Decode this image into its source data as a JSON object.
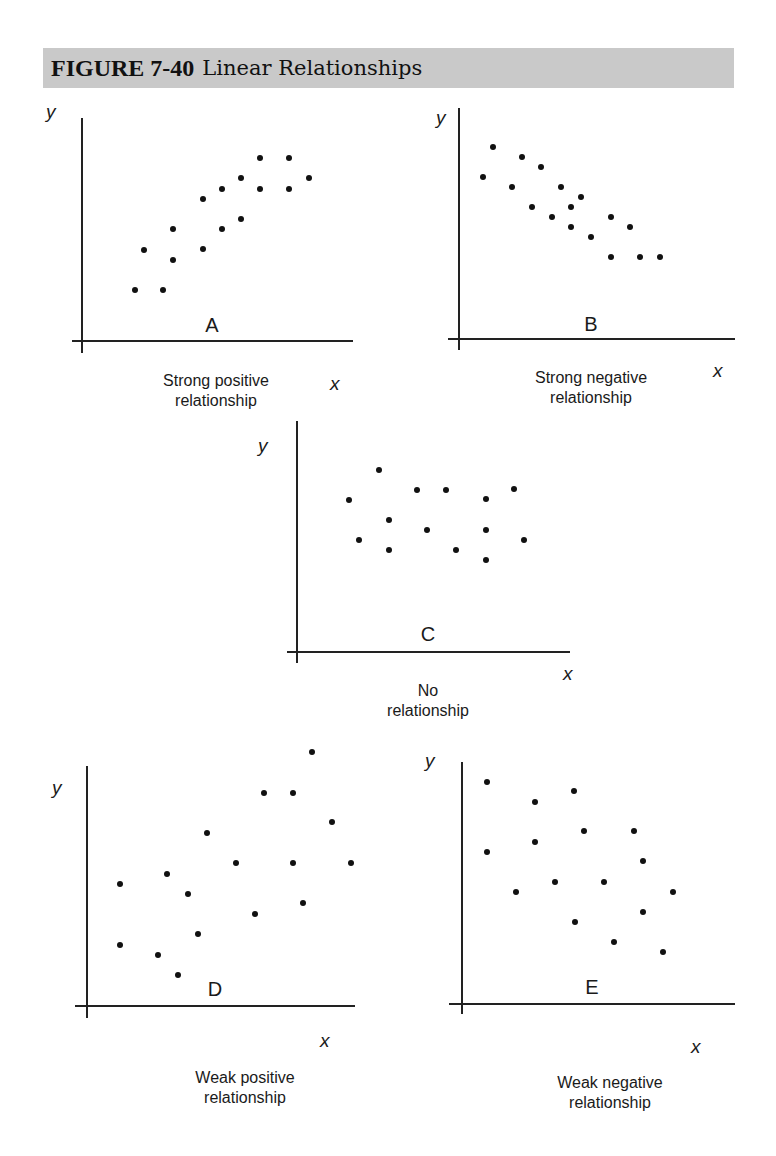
{
  "header": {
    "figure_number": "FIGURE 7-40",
    "title": "Linear Relationships"
  },
  "colors": {
    "header_bg": "#c9c9c9",
    "ink": "#111111"
  },
  "chart_data": [
    {
      "type": "scatter",
      "panel": "A",
      "title": "Strong positive relationship",
      "caption_lines": [
        "Strong positive",
        "relationship"
      ],
      "xlabel": "x",
      "ylabel": "y",
      "grid": false,
      "axes_px": {
        "origin": [
          82,
          341
        ],
        "y_top": 118,
        "y_bottom": 353,
        "x_left": 72,
        "x_right": 353
      },
      "label_px": {
        "y": [
          46,
          118
        ],
        "x": [
          330,
          390
        ],
        "letter": [
          212,
          332
        ],
        "caption": [
          216,
          386
        ]
      },
      "points_px": [
        [
          135,
          290
        ],
        [
          163,
          290
        ],
        [
          144,
          250
        ],
        [
          173,
          229
        ],
        [
          173,
          260
        ],
        [
          203,
          199
        ],
        [
          203,
          249
        ],
        [
          222,
          189
        ],
        [
          222,
          229
        ],
        [
          241,
          178
        ],
        [
          241,
          219
        ],
        [
          260,
          158
        ],
        [
          260,
          189
        ],
        [
          289,
          158
        ],
        [
          289,
          189
        ],
        [
          309,
          178
        ]
      ],
      "points": [
        [
          1.9,
          1.8
        ],
        [
          2.9,
          1.8
        ],
        [
          2.2,
          3.3
        ],
        [
          3.3,
          4.1
        ],
        [
          3.3,
          2.9
        ],
        [
          4.4,
          5.2
        ],
        [
          4.4,
          3.4
        ],
        [
          5.1,
          5.6
        ],
        [
          5.1,
          4.1
        ],
        [
          5.8,
          6.0
        ],
        [
          5.8,
          4.5
        ],
        [
          6.5,
          6.8
        ],
        [
          6.5,
          5.6
        ],
        [
          7.5,
          6.8
        ],
        [
          7.5,
          5.6
        ],
        [
          8.3,
          6.0
        ]
      ]
    },
    {
      "type": "scatter",
      "panel": "B",
      "title": "Strong negative relationship",
      "caption_lines": [
        "Strong negative",
        "relationship"
      ],
      "xlabel": "x",
      "ylabel": "y",
      "grid": false,
      "axes_px": {
        "origin": [
          459,
          339
        ],
        "y_top": 108,
        "y_bottom": 350,
        "x_left": 448,
        "x_right": 735
      },
      "label_px": {
        "y": [
          436,
          124
        ],
        "x": [
          713,
          377
        ],
        "letter": [
          591,
          331
        ],
        "caption": [
          591,
          383
        ]
      },
      "points_px": [
        [
          483,
          177
        ],
        [
          493,
          147
        ],
        [
          512,
          187
        ],
        [
          522,
          157
        ],
        [
          532,
          207
        ],
        [
          541,
          167
        ],
        [
          552,
          217
        ],
        [
          561,
          187
        ],
        [
          571,
          207
        ],
        [
          571,
          227
        ],
        [
          581,
          197
        ],
        [
          591,
          237
        ],
        [
          611,
          217
        ],
        [
          611,
          257
        ],
        [
          630,
          227
        ],
        [
          640,
          257
        ],
        [
          660,
          257
        ]
      ],
      "points": [
        [
          0.9,
          6.1
        ],
        [
          1.3,
          7.2
        ],
        [
          2.0,
          5.7
        ],
        [
          2.4,
          6.8
        ],
        [
          2.8,
          5.0
        ],
        [
          3.1,
          6.4
        ],
        [
          3.5,
          4.6
        ],
        [
          3.8,
          5.7
        ],
        [
          4.2,
          5.0
        ],
        [
          4.2,
          4.2
        ],
        [
          4.6,
          5.3
        ],
        [
          4.9,
          3.9
        ],
        [
          5.6,
          4.6
        ],
        [
          5.6,
          3.1
        ],
        [
          6.4,
          4.2
        ],
        [
          6.7,
          3.1
        ],
        [
          7.5,
          3.1
        ]
      ]
    },
    {
      "type": "scatter",
      "panel": "C",
      "title": "No relationship",
      "caption_lines": [
        "No",
        "relationship"
      ],
      "xlabel": "x",
      "ylabel": "y",
      "grid": false,
      "axes_px": {
        "origin": [
          297,
          652
        ],
        "y_top": 421,
        "y_bottom": 663,
        "x_left": 287,
        "x_right": 570
      },
      "label_px": {
        "y": [
          258,
          452
        ],
        "x": [
          563,
          680
        ],
        "letter": [
          428,
          641
        ],
        "caption": [
          428,
          696
        ]
      },
      "points_px": [
        [
          349,
          500
        ],
        [
          359,
          540
        ],
        [
          379,
          470
        ],
        [
          389,
          520
        ],
        [
          389,
          550
        ],
        [
          417,
          490
        ],
        [
          427,
          530
        ],
        [
          446,
          490
        ],
        [
          456,
          550
        ],
        [
          486,
          499
        ],
        [
          486,
          530
        ],
        [
          486,
          560
        ],
        [
          514,
          489
        ],
        [
          524,
          540
        ]
      ],
      "points": [
        [
          2.0,
          5.9
        ],
        [
          2.4,
          4.6
        ],
        [
          3.2,
          7.0
        ],
        [
          3.5,
          5.2
        ],
        [
          3.5,
          4.1
        ],
        [
          4.6,
          6.2
        ],
        [
          5.0,
          4.9
        ],
        [
          5.8,
          6.2
        ],
        [
          6.1,
          4.1
        ],
        [
          7.3,
          5.9
        ],
        [
          7.3,
          4.9
        ],
        [
          7.3,
          3.8
        ],
        [
          8.4,
          6.3
        ],
        [
          8.8,
          4.6
        ]
      ]
    },
    {
      "type": "scatter",
      "panel": "D",
      "title": "Weak positive relationship",
      "caption_lines": [
        "Weak positive",
        "relationship"
      ],
      "xlabel": "x",
      "ylabel": "y",
      "grid": false,
      "axes_px": {
        "origin": [
          87,
          1006
        ],
        "y_top": 766,
        "y_bottom": 1018,
        "x_left": 75,
        "x_right": 355
      },
      "label_px": {
        "y": [
          52,
          794
        ],
        "x": [
          320,
          1047
        ],
        "letter": [
          215,
          996
        ],
        "caption": [
          245,
          1083
        ]
      },
      "points_px": [
        [
          120,
          884
        ],
        [
          120,
          945
        ],
        [
          158,
          955
        ],
        [
          167,
          874
        ],
        [
          178,
          975
        ],
        [
          188,
          894
        ],
        [
          198,
          934
        ],
        [
          207,
          833
        ],
        [
          236,
          863
        ],
        [
          255,
          914
        ],
        [
          264,
          793
        ],
        [
          293,
          793
        ],
        [
          293,
          863
        ],
        [
          303,
          903
        ],
        [
          312,
          752
        ],
        [
          332,
          822
        ],
        [
          351,
          863
        ]
      ],
      "points": [
        [
          1.2,
          4.8
        ],
        [
          1.2,
          2.4
        ],
        [
          2.7,
          2.0
        ],
        [
          3.0,
          5.2
        ],
        [
          3.4,
          1.2
        ],
        [
          3.8,
          4.4
        ],
        [
          4.1,
          2.8
        ],
        [
          4.5,
          6.8
        ],
        [
          5.6,
          5.6
        ],
        [
          6.3,
          3.6
        ],
        [
          6.6,
          8.4
        ],
        [
          7.7,
          8.4
        ],
        [
          7.7,
          5.6
        ],
        [
          8.1,
          4.0
        ],
        [
          8.4,
          10.0
        ],
        [
          9.2,
          7.2
        ],
        [
          9.9,
          5.6
        ]
      ]
    },
    {
      "type": "scatter",
      "panel": "E",
      "title": "Weak negative relationship",
      "caption_lines": [
        "Weak negative",
        "relationship"
      ],
      "xlabel": "x",
      "ylabel": "y",
      "grid": false,
      "axes_px": {
        "origin": [
          462,
          1004
        ],
        "y_top": 762,
        "y_bottom": 1014,
        "x_left": 449,
        "x_right": 735
      },
      "label_px": {
        "y": [
          425,
          767
        ],
        "x": [
          691,
          1053
        ],
        "letter": [
          592,
          994
        ],
        "caption": [
          610,
          1088
        ]
      },
      "points_px": [
        [
          487,
          782
        ],
        [
          487,
          852
        ],
        [
          516,
          892
        ],
        [
          535,
          802
        ],
        [
          535,
          842
        ],
        [
          555,
          882
        ],
        [
          574,
          791
        ],
        [
          575,
          922
        ],
        [
          584,
          831
        ],
        [
          604,
          882
        ],
        [
          614,
          942
        ],
        [
          634,
          831
        ],
        [
          643,
          861
        ],
        [
          643,
          912
        ],
        [
          663,
          952
        ],
        [
          673,
          892
        ]
      ],
      "points": [
        [
          0.9,
          8.8
        ],
        [
          0.9,
          6.0
        ],
        [
          2.0,
          4.4
        ],
        [
          2.7,
          8.0
        ],
        [
          2.7,
          6.4
        ],
        [
          3.4,
          4.8
        ],
        [
          4.1,
          8.5
        ],
        [
          4.1,
          3.3
        ],
        [
          4.5,
          6.9
        ],
        [
          5.2,
          4.8
        ],
        [
          5.6,
          2.5
        ],
        [
          6.3,
          6.9
        ],
        [
          6.7,
          5.7
        ],
        [
          6.7,
          3.7
        ],
        [
          7.4,
          2.1
        ],
        [
          7.8,
          4.4
        ]
      ]
    }
  ]
}
